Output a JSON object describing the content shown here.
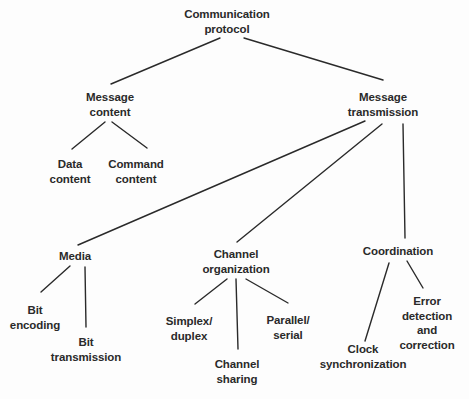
{
  "diagram": {
    "type": "tree",
    "line_color": "#2a2a2a",
    "nodes": {
      "root": {
        "line1": "Communication",
        "line2": "protocol"
      },
      "message_content": {
        "line1": "Message",
        "line2": "content"
      },
      "message_transmission": {
        "line1": "Message",
        "line2": "transmission"
      },
      "data_content": {
        "line1": "Data",
        "line2": "content"
      },
      "command_content": {
        "line1": "Command",
        "line2": "content"
      },
      "media": {
        "line1": "Media"
      },
      "channel_organization": {
        "line1": "Channel",
        "line2": "organization"
      },
      "coordination": {
        "line1": "Coordination"
      },
      "bit_encoding": {
        "line1": "Bit",
        "line2": "encoding"
      },
      "bit_transmission": {
        "line1": "Bit",
        "line2": "transmission"
      },
      "simplex_duplex": {
        "line1": "Simplex/",
        "line2": "duplex"
      },
      "channel_sharing": {
        "line1": "Channel",
        "line2": "sharing"
      },
      "parallel_serial": {
        "line1": "Parallel/",
        "line2": "serial"
      },
      "clock_synchronization": {
        "line1": "Clock",
        "line2": "synchronization"
      },
      "error_detection": {
        "line1": "Error",
        "line2": "detection",
        "line3": "and",
        "line4": "correction"
      }
    },
    "edges": [
      [
        "root",
        "message_content"
      ],
      [
        "root",
        "message_transmission"
      ],
      [
        "message_content",
        "data_content"
      ],
      [
        "message_content",
        "command_content"
      ],
      [
        "message_transmission",
        "media"
      ],
      [
        "message_transmission",
        "channel_organization"
      ],
      [
        "message_transmission",
        "coordination"
      ],
      [
        "media",
        "bit_encoding"
      ],
      [
        "media",
        "bit_transmission"
      ],
      [
        "channel_organization",
        "simplex_duplex"
      ],
      [
        "channel_organization",
        "channel_sharing"
      ],
      [
        "channel_organization",
        "parallel_serial"
      ],
      [
        "coordination",
        "clock_synchronization"
      ],
      [
        "coordination",
        "error_detection"
      ]
    ]
  }
}
